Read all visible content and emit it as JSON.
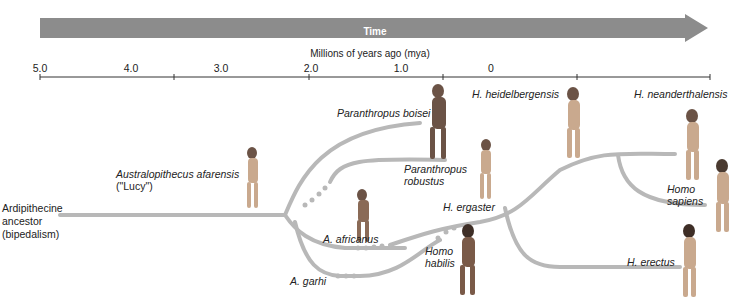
{
  "title_arrow": {
    "label": "Time",
    "color": "#8c8c8c"
  },
  "axis": {
    "title": "Millions of years ago (mya)",
    "ticks": [
      {
        "label": "5.0",
        "x": 40
      },
      {
        "label": "4.0",
        "x": 131
      },
      {
        "label": "3.0",
        "x": 221
      },
      {
        "label": "2.0",
        "x": 311
      },
      {
        "label": "1.0",
        "x": 401
      },
      {
        "label": "0",
        "x": 491
      }
    ]
  },
  "ancestor": {
    "line1": "Ardipithecine",
    "line2": "ancestor",
    "line3": "(bipedalism)"
  },
  "species": {
    "afarensis": {
      "name": "Australopithecus afarensis",
      "nickname": "(\"Lucy\")"
    },
    "boisei": {
      "name": "Paranthropus boisei"
    },
    "robustus": {
      "line1": "Paranthropus",
      "line2": "robustus"
    },
    "africanus": {
      "name": "A. africanus"
    },
    "garhi": {
      "name": "A. garhi"
    },
    "habilis": {
      "line1": "Homo",
      "line2": "habilis"
    },
    "ergaster": {
      "name": "H. ergaster"
    },
    "heidelbergensis": {
      "name": "H. heidelbergensis"
    },
    "neanderthalensis": {
      "name": "H. neanderthalensis"
    },
    "sapiens": {
      "line1": "Homo",
      "line2": "sapiens"
    },
    "erectus": {
      "name": "H. erectus"
    }
  },
  "colors": {
    "branch": "#b8b8b8",
    "figure": "#c9a98e",
    "figure_dark": "#6b5346"
  }
}
